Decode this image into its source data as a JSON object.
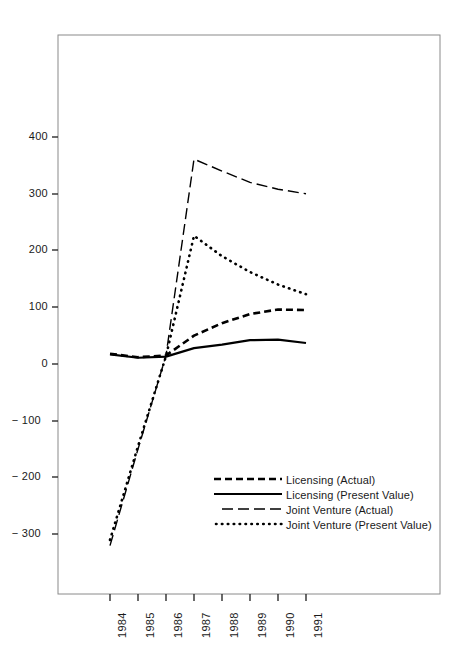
{
  "chart_data": {
    "type": "line",
    "title": "",
    "xlabel": "",
    "ylabel": "Thousands of\nDollars",
    "x": [
      1984,
      1985,
      1986,
      1987,
      1988,
      1989,
      1990,
      1991
    ],
    "categories": [
      "1984",
      "1985",
      "1986",
      "1987",
      "1988",
      "1989",
      "1990",
      "1991"
    ],
    "ylim": [
      -340,
      460
    ],
    "yticks": [
      400,
      300,
      200,
      100,
      0,
      -100,
      -200,
      -300
    ],
    "ytick_labels": [
      "400",
      "300",
      "200",
      "100",
      "0",
      "− 100",
      "− 200",
      "− 300"
    ],
    "grid": false,
    "legend_position": "lower-center-right",
    "series": [
      {
        "name": "Licensing (Actual)",
        "style": "dashed",
        "color": "#000000",
        "values": [
          18,
          12,
          15,
          50,
          72,
          88,
          96,
          95
        ]
      },
      {
        "name": "Licensing (Present Value)",
        "style": "solid",
        "color": "#000000",
        "values": [
          17,
          11,
          13,
          28,
          34,
          42,
          43,
          37
        ]
      },
      {
        "name": "Joint Venture (Actual)",
        "style": "long-dash",
        "color": "#000000",
        "values": [
          -320,
          -150,
          15,
          361,
          340,
          320,
          308,
          300
        ]
      },
      {
        "name": "Joint Venture (Present Value)",
        "style": "dotted",
        "color": "#000000",
        "values": [
          -310,
          -145,
          14,
          226,
          190,
          162,
          140,
          123
        ]
      }
    ]
  },
  "axis": {
    "y_title_line1": "Thousands of",
    "y_title_line2": "Dollars",
    "y_title": "Thousands of\nDollars"
  },
  "yticks": [
    {
      "label": "400"
    },
    {
      "label": "300"
    },
    {
      "label": "200"
    },
    {
      "label": "100"
    },
    {
      "label": "0"
    },
    {
      "label": "− 100"
    },
    {
      "label": "− 200"
    },
    {
      "label": "− 300"
    }
  ],
  "xticks": [
    {
      "label": "1984"
    },
    {
      "label": "1985"
    },
    {
      "label": "1986"
    },
    {
      "label": "1987"
    },
    {
      "label": "1988"
    },
    {
      "label": "1989"
    },
    {
      "label": "1990"
    },
    {
      "label": "1991"
    }
  ],
  "legend": [
    {
      "label": "Licensing (Actual)",
      "style": "dashed"
    },
    {
      "label": "Licensing (Present Value)",
      "style": "solid"
    },
    {
      "label": "Joint Venture (Actual)",
      "style": "long-dash"
    },
    {
      "label": "Joint Venture (Present Value)",
      "style": "dotted"
    }
  ],
  "colors": {
    "ink": "#1a1a1a",
    "frame": "#7a7a7a",
    "series": "#000000",
    "background": "#ffffff"
  }
}
